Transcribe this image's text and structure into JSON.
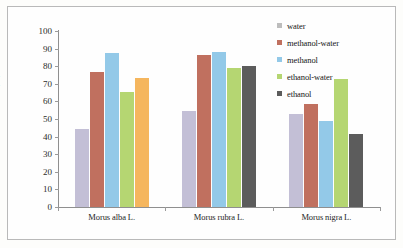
{
  "chart_data": {
    "type": "bar",
    "title": "",
    "subtitle": "",
    "xlabel": "",
    "ylabel": "RSC (%)",
    "ylim": [
      0,
      100
    ],
    "ytick_step": 10,
    "yticks": [
      100,
      90,
      80,
      70,
      60,
      50,
      40,
      30,
      20,
      10,
      0
    ],
    "grid": false,
    "legend_position": "top-right",
    "categories": [
      "Morus alba L.",
      "Morus rubra L.",
      "Morus nigra L."
    ],
    "series": [
      {
        "name": "water",
        "color": "#c3bfd6",
        "legend_color": "#bdbdbd",
        "values": [
          44.3,
          54.6,
          52.9
        ]
      },
      {
        "name": "methanol-water",
        "color": "#c0705f",
        "legend_color": "#c0705f",
        "values": [
          76.9,
          86.2,
          58.8
        ]
      },
      {
        "name": "methanol",
        "color": "#93c9e8",
        "legend_color": "#93c9e8",
        "values": [
          87.4,
          88.2,
          49.0
        ]
      },
      {
        "name": "ethanol-water",
        "color": "#b5d672",
        "legend_color": "#b5d672",
        "values": [
          65.5,
          79.2,
          72.6
        ]
      },
      {
        "name": "ethanol",
        "color": "#5c5c5c",
        "legend_color": "#5c5c5c",
        "values": [
          73.2,
          80.4,
          41.6
        ],
        "bar_colors": [
          "#f5b65e",
          "#5c5c5c",
          "#5c5c5c"
        ]
      }
    ]
  },
  "legend": {
    "items": [
      {
        "label": "water"
      },
      {
        "label": "methanol-water"
      },
      {
        "label": "methanol"
      },
      {
        "label": "ethanol-water"
      },
      {
        "label": "ethanol"
      }
    ]
  }
}
